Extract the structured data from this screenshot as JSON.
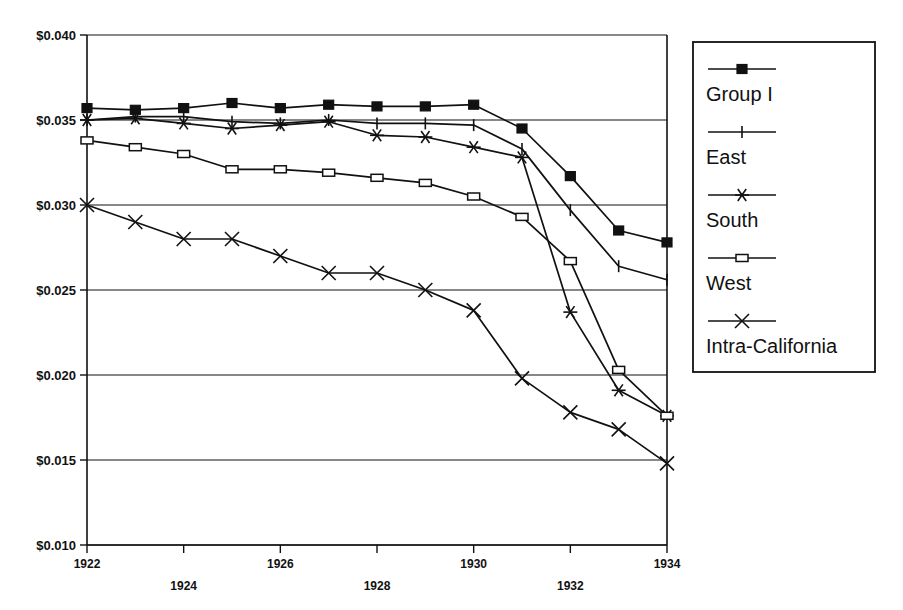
{
  "chart_data": {
    "type": "line",
    "title": "",
    "xlabel": "",
    "ylabel": "",
    "x": [
      1922,
      1923,
      1924,
      1925,
      1926,
      1927,
      1928,
      1929,
      1930,
      1931,
      1932,
      1933,
      1934
    ],
    "xlim": [
      1922,
      1934
    ],
    "ylim": [
      0.01,
      0.04
    ],
    "y_ticks": [
      0.01,
      0.015,
      0.02,
      0.025,
      0.03,
      0.035,
      0.04
    ],
    "y_tick_labels": [
      "$0.010",
      "$0.015",
      "$0.020",
      "$0.025",
      "$0.030",
      "$0.035",
      "$0.040"
    ],
    "x_ticks": [
      1922,
      1924,
      1926,
      1928,
      1930,
      1932,
      1934
    ],
    "x_tick_labels": [
      "1922",
      "1924",
      "1926",
      "1928",
      "1930",
      "1932",
      "1934"
    ],
    "x_tick_labels_upper": [
      "1922",
      "1926",
      "1930",
      "1934"
    ],
    "x_tick_labels_lower": [
      "1924",
      "1928",
      "1932"
    ],
    "grid": "horizontal",
    "legend_position": "right",
    "series": [
      {
        "name": "Group I",
        "marker": "filled-square",
        "values": [
          0.0357,
          0.0356,
          0.0357,
          0.036,
          0.0357,
          0.0359,
          0.0358,
          0.0358,
          0.0359,
          0.0345,
          0.0317,
          0.0285,
          0.0278
        ]
      },
      {
        "name": "East",
        "marker": "plus",
        "values": [
          0.035,
          0.0352,
          0.0352,
          0.0349,
          0.0348,
          0.035,
          0.0348,
          0.0348,
          0.0347,
          0.0333,
          0.0297,
          0.0264,
          0.0256
        ]
      },
      {
        "name": "South",
        "marker": "asterisk",
        "values": [
          0.035,
          0.0351,
          0.0348,
          0.0345,
          0.0347,
          0.0349,
          0.0341,
          0.034,
          0.0334,
          0.0328,
          0.0306,
          0.0282,
          0.0268
        ]
      },
      {
        "name": "West",
        "marker": "open-square",
        "values": [
          0.0338,
          0.0334,
          0.033,
          0.0321,
          0.0321,
          0.0319,
          0.0316,
          0.0313,
          0.0305,
          0.0293,
          0.0267,
          0.0237,
          0.0203
        ]
      },
      {
        "name": "Intra-California",
        "marker": "cross",
        "values": [
          0.03,
          0.029,
          0.028,
          0.028,
          0.027,
          0.026,
          0.026,
          0.025,
          0.0238,
          0.0198,
          0.0178,
          0.0168,
          0.0148
        ]
      }
    ],
    "series_extra_branch": {
      "note": "South and West descend to a shared endpoint at 1934",
      "south_endpoint": 0.0176,
      "west_endpoint": 0.0176,
      "east_endpoint": 0.0256,
      "south_1932": 0.0237,
      "south_1933": 0.0191,
      "west_1933": 0.0203
    }
  },
  "legend": {
    "entries": [
      {
        "label": "Group I",
        "marker": "filled-square"
      },
      {
        "label": "East",
        "marker": "plus"
      },
      {
        "label": "South",
        "marker": "asterisk"
      },
      {
        "label": "West",
        "marker": "open-square"
      },
      {
        "label": "Intra-California",
        "marker": "cross"
      }
    ]
  },
  "colors": {
    "ink": "#111111",
    "background": "#ffffff"
  }
}
